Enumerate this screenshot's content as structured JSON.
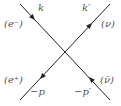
{
  "diagram": {
    "type": "feynman-vertex",
    "line_color": "#222222",
    "label_color": "#555555",
    "lines": [
      {
        "name": "electron-line",
        "from": [
          20,
          4
        ],
        "to": [
          110,
          100
        ]
      },
      {
        "name": "neutrino-line",
        "from": [
          20,
          100
        ],
        "to": [
          110,
          4
        ]
      }
    ],
    "labels": {
      "k": "k",
      "electron": "(e⁻)",
      "k_prime": "k′",
      "neutrino": "(ν)",
      "positron": "(e⁺)",
      "minus_p": "−p",
      "minus_p_prime": "−p′",
      "antineutrino": "(ν̄)"
    }
  }
}
